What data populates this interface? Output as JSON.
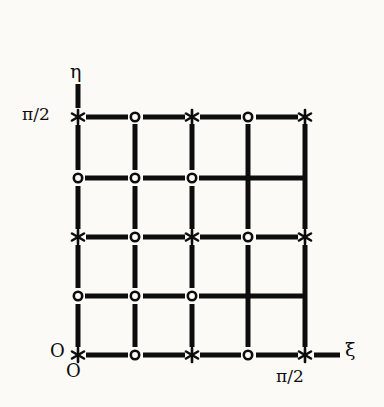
{
  "figure": {
    "kind": "grid-diagram",
    "background_color": "#fbfaf6",
    "ink_color": "#0d0d0d",
    "axes": {
      "x_axis_label": "ξ",
      "y_axis_label": "η",
      "origin_label_left": "O",
      "origin_label_below": "O",
      "x_max_tick_label": "π/2",
      "y_max_tick_label": "π/2"
    },
    "grid": {
      "columns": 5,
      "rows": 5,
      "x_positions": [
        78,
        135,
        192,
        248,
        305
      ],
      "y_positions": [
        117,
        178,
        237,
        296,
        355
      ],
      "x_range": [
        0,
        1.5708
      ],
      "y_range": [
        0,
        1.5708
      ],
      "marker_rows": [
        [
          "star",
          "circle",
          "star",
          "circle",
          "star"
        ],
        [
          "circle",
          "circle",
          "circle",
          "none",
          "none"
        ],
        [
          "star",
          "circle",
          "star",
          "circle",
          "star"
        ],
        [
          "circle",
          "circle",
          "circle",
          "none",
          "none"
        ],
        [
          "star",
          "circle",
          "star",
          "circle",
          "star"
        ]
      ]
    },
    "markers": {
      "star_glyph": "*",
      "circle_glyph": "o"
    }
  }
}
